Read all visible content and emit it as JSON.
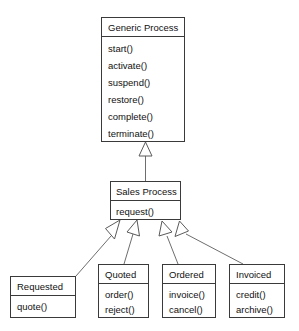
{
  "diagram": {
    "type": "uml-class-diagram",
    "background_color": "#ffffff",
    "line_color": "#6e6e6e",
    "box_border_color": "#3a3a3a",
    "text_color": "#111111",
    "relationship": "generalization"
  },
  "classes": {
    "generic_process": {
      "name": "Generic Process",
      "methods": [
        "start()",
        "activate()",
        "suspend()",
        "restore()",
        "complete()",
        "terminate()"
      ]
    },
    "sales_process": {
      "name": "Sales Process",
      "methods": [
        "request()"
      ]
    },
    "requested": {
      "name": "Requested",
      "methods": [
        "quote()"
      ]
    },
    "quoted": {
      "name": "Quoted",
      "methods": [
        "order()",
        "reject()"
      ]
    },
    "ordered": {
      "name": "Ordered",
      "methods": [
        "invoice()",
        "cancel()"
      ]
    },
    "invoiced": {
      "name": "Invoiced",
      "methods": [
        "credit()",
        "archive()"
      ]
    }
  }
}
